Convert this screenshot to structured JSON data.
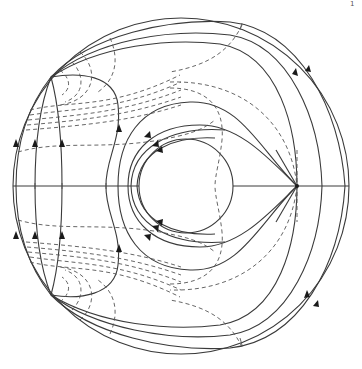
{
  "figure": {
    "type": "field-line diagram",
    "page_mark": "1",
    "outer_circle": {
      "cx": 181,
      "cy": 186,
      "r": 168
    },
    "inner_circle": {
      "cx": 186,
      "cy": 186,
      "r": 47
    },
    "axis": {
      "y": 186,
      "x1": 13,
      "x2": 349
    },
    "singular_points": [
      {
        "name": "upper-left",
        "x": 51,
        "y": 77
      },
      {
        "name": "lower-left",
        "x": 51,
        "y": 295
      },
      {
        "name": "x-point",
        "x": 297,
        "y": 186
      }
    ],
    "colors": {
      "line": "#3a3a3a",
      "dashed": "#555555",
      "background": "#ffffff"
    }
  }
}
